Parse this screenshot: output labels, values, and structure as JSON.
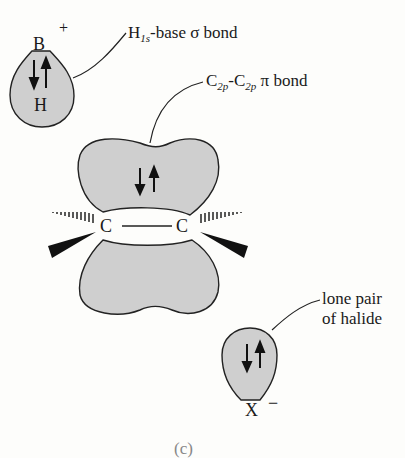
{
  "diagram": {
    "labels": {
      "sigma_bond": {
        "prefix": "H",
        "sub": "1s",
        "text": "-base σ bond"
      },
      "pi_bond": {
        "c1": "C",
        "sub1": "2p",
        "dash": "-",
        "c2": "C",
        "sub2": "2p",
        "text": " π bond"
      },
      "lone_pair_line1": "lone pair",
      "lone_pair_line2": "of halide"
    },
    "atoms": {
      "boron": "B",
      "boron_charge": "+",
      "hydrogen": "H",
      "carbon_left": "C",
      "carbon_right": "C",
      "halide": "X",
      "halide_charge": "−"
    },
    "caption": "(c)",
    "colors": {
      "orbital_fill": "#cfcfcf",
      "stroke": "#222222"
    }
  }
}
